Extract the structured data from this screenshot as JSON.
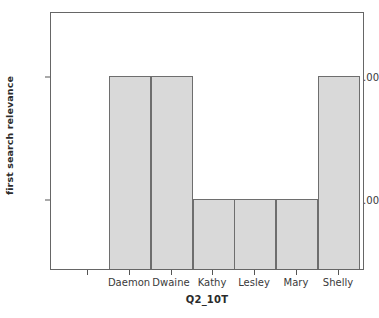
{
  "chart_data": {
    "type": "bar",
    "title": "",
    "subtitle": "",
    "xlabel": "Q2_10T",
    "ylabel": "first search relevance",
    "categories": [
      "Daemon",
      "Dwaine",
      "Kathy",
      "Lesley",
      "Mary",
      "Shelly"
    ],
    "values": [
      3.0,
      3.0,
      2.0,
      2.0,
      2.0,
      3.0
    ],
    "y_ticks": [
      2.0,
      3.0
    ],
    "y_tick_labels": [
      "2.00",
      "3.00"
    ],
    "ylim": [
      1.55,
      3.6
    ],
    "grid": false,
    "legend": null,
    "bar_color": "#d9d9d9",
    "bar_edge_color": "#6e6e6e",
    "frame_color": "#666666",
    "background": "#ffffff",
    "annotations": []
  },
  "axes": {
    "y_title": "first search relevance",
    "x_title": "Q2_10T",
    "y_tick_labels": [
      "3.00",
      "2.00"
    ],
    "x_tick_labels": [
      "Daemon",
      "Dwaine",
      "Kathy",
      "Lesley",
      "Mary",
      "Shelly"
    ]
  }
}
